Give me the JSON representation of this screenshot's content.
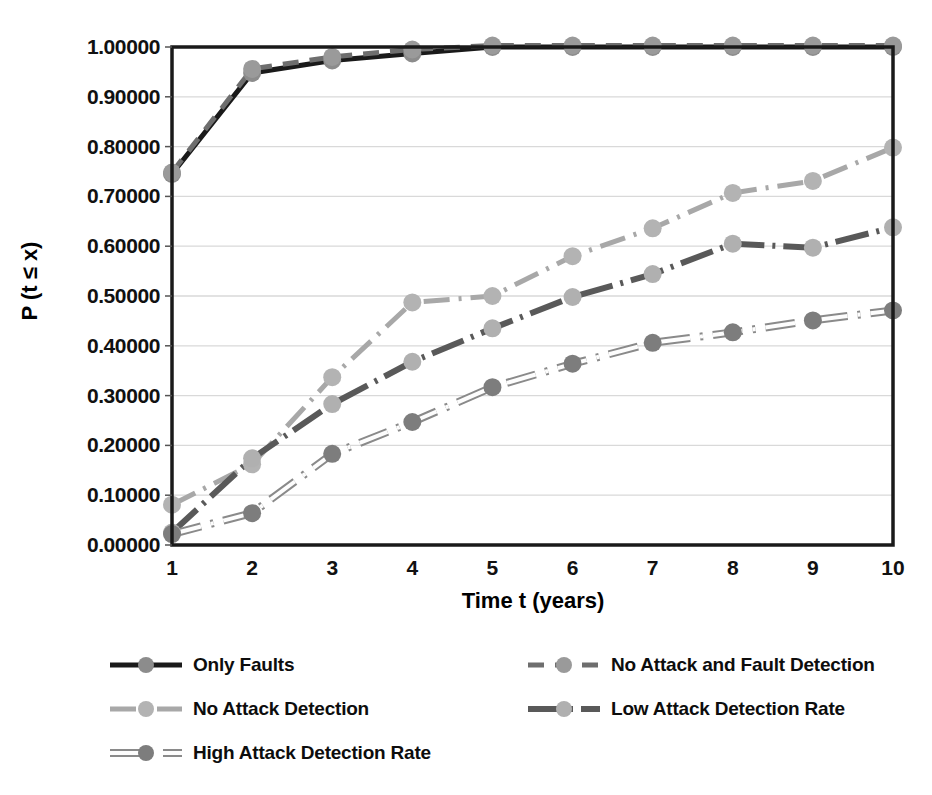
{
  "chart_data": {
    "type": "line",
    "title": "",
    "xlabel": "Time t (years)",
    "ylabel": "P (t ≤ x)",
    "x": [
      1,
      2,
      3,
      4,
      5,
      6,
      7,
      8,
      9,
      10
    ],
    "xlim": [
      1,
      10
    ],
    "ylim": [
      0.0,
      1.0
    ],
    "grid": true,
    "legend_position": "bottom",
    "xticklabels": [
      "1",
      "2",
      "3",
      "4",
      "5",
      "6",
      "7",
      "8",
      "9",
      "10"
    ],
    "yticklabels": [
      "0.00000",
      "0.10000",
      "0.20000",
      "0.30000",
      "0.40000",
      "0.50000",
      "0.60000",
      "0.70000",
      "0.80000",
      "0.90000",
      "1.00000"
    ],
    "ytickvalues": [
      0.0,
      0.1,
      0.2,
      0.3,
      0.4,
      0.5,
      0.6,
      0.7,
      0.8,
      0.9,
      1.0
    ],
    "series": [
      {
        "name": "Only Faults",
        "color": "#1a1a1a",
        "marker_color": "#8c8c8c",
        "style": "solid",
        "width": 5,
        "values": [
          0.745,
          0.948,
          0.973,
          0.987,
          1.0,
          1.0,
          1.0,
          1.0,
          1.0,
          1.0
        ]
      },
      {
        "name": "No Attack and Fault Detection",
        "color": "#6e6e6e",
        "marker_color": "#9a9a9a",
        "style": "dashed",
        "width": 5,
        "values": [
          0.748,
          0.956,
          0.98,
          0.995,
          1.003,
          1.003,
          1.003,
          1.003,
          1.003,
          1.003
        ]
      },
      {
        "name": "No Attack Detection",
        "color": "#a8a8a8",
        "marker_color": "#b3b3b3",
        "style": "dashdot",
        "width": 5,
        "values": [
          0.081,
          0.162,
          0.337,
          0.487,
          0.5,
          0.58,
          0.636,
          0.707,
          0.731,
          0.798
        ]
      },
      {
        "name": "Low Attack Detection Rate",
        "color": "#595959",
        "marker_color": "#b0b0b0",
        "style": "dashdot-long",
        "width": 6,
        "values": [
          0.025,
          0.174,
          0.283,
          0.368,
          0.435,
          0.498,
          0.544,
          0.605,
          0.597,
          0.638
        ]
      },
      {
        "name": "High Attack Detection Rate",
        "color": "#d0d0d0",
        "marker_color": "#7d7d7d",
        "style": "dotted-outline",
        "width": 6,
        "values": [
          0.022,
          0.064,
          0.183,
          0.247,
          0.317,
          0.364,
          0.406,
          0.427,
          0.451,
          0.471
        ]
      }
    ]
  },
  "axes": {
    "frame_color": "#1a1a1a",
    "gridline_color": "#d9d9d9",
    "background": "#ffffff"
  },
  "legend": {
    "entries": [
      {
        "label": "Only Faults",
        "column": 0,
        "row": 0
      },
      {
        "label": "No Attack and Fault Detection",
        "column": 1,
        "row": 0
      },
      {
        "label": "No Attack Detection",
        "column": 0,
        "row": 1
      },
      {
        "label": "Low Attack Detection Rate",
        "column": 1,
        "row": 1
      },
      {
        "label": "High Attack Detection Rate",
        "column": 0,
        "row": 2
      }
    ]
  }
}
